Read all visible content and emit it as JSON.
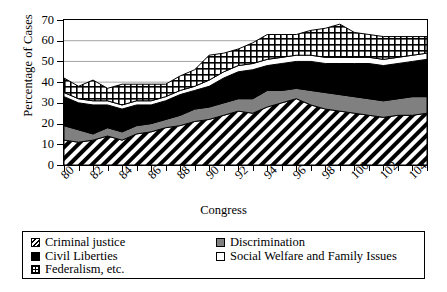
{
  "chart_data": {
    "type": "area",
    "title": "",
    "xlabel": "Congress",
    "ylabel": "Percentage of Cases",
    "ylim": [
      0,
      70
    ],
    "ytick_labels": [
      "0",
      "10",
      "20",
      "30",
      "40",
      "50",
      "60",
      "70"
    ],
    "ytick_values": [
      0,
      10,
      20,
      30,
      40,
      50,
      60,
      70
    ],
    "grid": true,
    "stacked": true,
    "legend_position": "bottom",
    "x": [
      80,
      81,
      82,
      83,
      84,
      85,
      86,
      87,
      88,
      89,
      90,
      91,
      92,
      93,
      94,
      95,
      96,
      97,
      98,
      99,
      100,
      101,
      102,
      103,
      104,
      105
    ],
    "xtick_labels": [
      "80",
      "",
      "82",
      "",
      "84",
      "",
      "86",
      "",
      "88",
      "",
      "90",
      "",
      "92",
      "",
      "94",
      "",
      "96",
      "",
      "98",
      "",
      "100",
      "",
      "102",
      "",
      "104",
      ""
    ],
    "xtick_labels_shown": [
      "80",
      "82",
      "84",
      "86",
      "88",
      "90",
      "92",
      "94",
      "96",
      "98",
      "100",
      "102",
      "104"
    ],
    "series": [
      {
        "name": "Criminal justice",
        "pattern": "diagonal-stripes",
        "values": [
          12,
          11,
          12,
          14,
          12,
          15,
          16,
          18,
          19,
          21,
          22,
          24,
          26,
          25,
          28,
          30,
          32,
          29,
          27,
          26,
          25,
          24,
          23,
          24,
          24,
          25
        ]
      },
      {
        "name": "Discrimination",
        "pattern": "solid-gray",
        "color": "#808080",
        "values": [
          7,
          6,
          3,
          4,
          4,
          4,
          4,
          4,
          5,
          6,
          6,
          6,
          6,
          7,
          8,
          6,
          5,
          7,
          8,
          8,
          8,
          8,
          8,
          8,
          9,
          8
        ]
      },
      {
        "name": "Civil Liberties",
        "pattern": "solid-black",
        "color": "#000000",
        "values": [
          14,
          13,
          14,
          11,
          11,
          10,
          9,
          9,
          10,
          9,
          10,
          12,
          13,
          14,
          12,
          13,
          13,
          14,
          14,
          15,
          16,
          17,
          17,
          17,
          17,
          18
        ]
      },
      {
        "name": "Social Welfare and Family Issues",
        "pattern": "solid-white",
        "color": "#ffffff",
        "values": [
          2,
          2,
          2,
          2,
          2,
          2,
          2,
          2,
          2,
          2,
          3,
          3,
          3,
          3,
          3,
          3,
          3,
          3,
          3,
          3,
          3,
          3,
          3,
          3,
          3,
          3
        ]
      },
      {
        "name": "Federalism, etc.",
        "pattern": "crosshatch",
        "values": [
          7,
          6,
          10,
          6,
          10,
          8,
          8,
          6,
          7,
          8,
          12,
          9,
          8,
          10,
          12,
          11,
          10,
          12,
          14,
          16,
          12,
          11,
          11,
          10,
          9,
          8
        ]
      }
    ]
  },
  "axes": {
    "ytitle": "Percentage of Cases",
    "xtitle": "Congress"
  },
  "legend": {
    "column1": [
      {
        "label": "Criminal justice",
        "swatch": "diagonal-stripes"
      },
      {
        "label": "Civil Liberties",
        "swatch": "solid-black"
      },
      {
        "label": "Federalism, etc.",
        "swatch": "crosshatch"
      }
    ],
    "column2": [
      {
        "label": "Discrimination",
        "swatch": "solid-gray"
      },
      {
        "label": "Social Welfare and Family Issues",
        "swatch": "solid-white"
      }
    ]
  }
}
